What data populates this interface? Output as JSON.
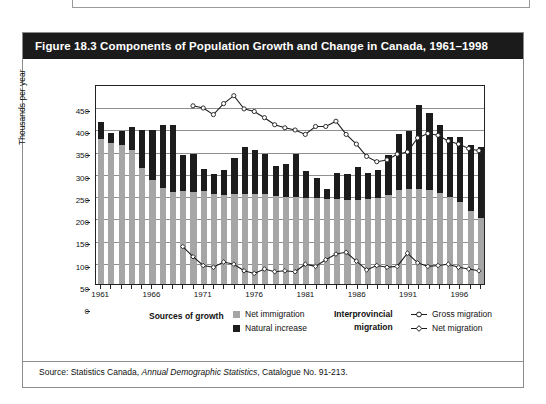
{
  "figure": {
    "title": "Figure 18.3 Components of Population Growth and Change in Canada, 1961–1998",
    "source_prefix": "Source: Statistics Canada, ",
    "source_italic": "Annual Demographic Statistics",
    "source_suffix": ", Catalogue No. 91-213."
  },
  "legend": {
    "group1_title": "Sources of growth",
    "group2_title_line1": "Interprovincial",
    "group2_title_line2": "migration",
    "items": [
      {
        "label": "Net immigration",
        "marker": "square",
        "color": "#a6a6a6"
      },
      {
        "label": "Natural increase",
        "marker": "square",
        "color": "#1c1c1c"
      },
      {
        "label": "Gross migration",
        "marker": "line-circle",
        "color": "#1c1c1c"
      },
      {
        "label": "Net migration",
        "marker": "line-diamond",
        "color": "#1c1c1c"
      }
    ]
  },
  "colors": {
    "net_immigration": "#a6a6a6",
    "natural_increase": "#1c1c1c",
    "line": "#1c1c1c",
    "title_bar_bg": "#1b1b1b",
    "title_bar_fg": "#ffffff",
    "grid": "#8f8f8f",
    "axis": "#222222",
    "panel_bg": "#ffffff",
    "border": "#8c8c8c"
  },
  "chart_data": {
    "type": "bar",
    "title": "Figure 18.3 Components of Population Growth and Change in Canada, 1961–1998",
    "subtitle": "",
    "xlabel": "",
    "ylabel": "Thousands per year",
    "ylim": [
      0,
      450
    ],
    "ytick_step": 50,
    "yticks": [
      0,
      50,
      100,
      150,
      200,
      250,
      300,
      350,
      400,
      450
    ],
    "grid": true,
    "legend_position": "below-plot",
    "xlim": [
      1961,
      1998
    ],
    "categories": [
      1961,
      1962,
      1963,
      1964,
      1965,
      1966,
      1967,
      1968,
      1969,
      1970,
      1971,
      1972,
      1973,
      1974,
      1975,
      1976,
      1977,
      1978,
      1979,
      1980,
      1981,
      1982,
      1983,
      1984,
      1985,
      1986,
      1987,
      1988,
      1989,
      1990,
      1991,
      1992,
      1993,
      1994,
      1995,
      1996,
      1997,
      1998
    ],
    "xtick_labels": [
      1961,
      1966,
      1971,
      1976,
      1981,
      1986,
      1991,
      1996
    ],
    "stacked": true,
    "series": [
      {
        "name": "Net immigration",
        "type": "bar-segment",
        "color": "#a6a6a6",
        "values": [
          330,
          322,
          318,
          307,
          265,
          238,
          220,
          212,
          214,
          212,
          213,
          208,
          205,
          206,
          208,
          208,
          208,
          203,
          200,
          200,
          198,
          198,
          196,
          195,
          193,
          193,
          195,
          198,
          205,
          215,
          218,
          218,
          215,
          210,
          200,
          190,
          168,
          152
        ]
      },
      {
        "name": "Natural increase",
        "type": "bar-segment",
        "color": "#1c1c1c",
        "values": [
          38,
          23,
          30,
          50,
          85,
          112,
          142,
          150,
          81,
          85,
          50,
          45,
          56,
          82,
          105,
          98,
          90,
          68,
          75,
          96,
          60,
          45,
          22,
          60,
          58,
          75,
          60,
          63,
          90,
          128,
          130,
          190,
          175,
          153,
          135,
          145,
          150,
          160
        ]
      }
    ],
    "bar_totals": [
      368,
      345,
      348,
      357,
      350,
      350,
      362,
      362,
      295,
      297,
      263,
      253,
      261,
      288,
      313,
      306,
      298,
      271,
      275,
      296,
      258,
      243,
      218,
      255,
      251,
      268,
      255,
      261,
      295,
      343,
      348,
      408,
      390,
      363,
      335,
      335,
      318,
      312
    ],
    "lines": [
      {
        "name": "Gross migration",
        "marker": "circle-open",
        "color": "#1c1c1c",
        "start_year": 1970,
        "x": [
          1970,
          1971,
          1972,
          1973,
          1974,
          1975,
          1976,
          1977,
          1978,
          1979,
          1980,
          1981,
          1982,
          1983,
          1984,
          1985,
          1986,
          1987,
          1988,
          1989,
          1990,
          1991,
          1992,
          1993,
          1994,
          1995,
          1996,
          1997,
          1998
        ],
        "values": [
          405,
          400,
          385,
          410,
          428,
          398,
          392,
          378,
          362,
          355,
          350,
          340,
          358,
          358,
          370,
          340,
          318,
          290,
          278,
          282,
          295,
          300,
          332,
          342,
          338,
          325,
          318,
          308,
          303,
          340
        ]
      },
      {
        "name": "Net migration",
        "marker": "diamond-open",
        "color": "#1c1c1c",
        "start_year": 1969,
        "x": [
          1969,
          1970,
          1971,
          1972,
          1973,
          1974,
          1975,
          1976,
          1977,
          1978,
          1979,
          1980,
          1981,
          1982,
          1983,
          1984,
          1985,
          1986,
          1987,
          1988,
          1989,
          1990,
          1991,
          1992,
          1993,
          1994,
          1995,
          1996,
          1997,
          1998
        ],
        "values": [
          85,
          62,
          42,
          38,
          50,
          45,
          30,
          24,
          34,
          28,
          30,
          28,
          45,
          40,
          55,
          68,
          72,
          52,
          32,
          42,
          38,
          40,
          70,
          48,
          40,
          42,
          45,
          38,
          34,
          30,
          28,
          24,
          22,
          26,
          34
        ]
      }
    ]
  }
}
